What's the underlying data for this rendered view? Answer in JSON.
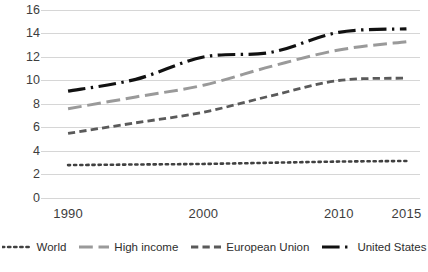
{
  "chart_data": {
    "type": "line",
    "title": "",
    "subtitle": "",
    "xlabel": "",
    "ylabel": "",
    "x": [
      1990,
      2000,
      2010,
      2015
    ],
    "categories": [
      "1990",
      "2000",
      "2010",
      "2015"
    ],
    "xtick_labels": [
      "1990",
      "2000",
      "2010",
      "2015"
    ],
    "ytick_labels": [
      "0",
      "2",
      "4",
      "6",
      "8",
      "10",
      "12",
      "14",
      "16"
    ],
    "yticks": [
      0,
      2,
      4,
      6,
      8,
      10,
      12,
      14,
      16
    ],
    "ylim": [
      0,
      16
    ],
    "xlim": [
      1988,
      2016
    ],
    "grid": "horizontal",
    "legend_position": "bottom",
    "series": [
      {
        "name": "World",
        "x": [
          1990,
          1995,
          2000,
          2005,
          2010,
          2015
        ],
        "values": [
          2.8,
          2.85,
          2.9,
          3.0,
          3.1,
          3.15
        ],
        "color": "#404040",
        "dash": "dotted",
        "width": 2.6
      },
      {
        "name": "High income",
        "x": [
          1990,
          1995,
          2000,
          2005,
          2010,
          2015
        ],
        "values": [
          7.6,
          8.6,
          9.6,
          11.2,
          12.6,
          13.3
        ],
        "color": "#9a9a9a",
        "dash": "long-dash",
        "width": 3.0
      },
      {
        "name": "European Union",
        "x": [
          1990,
          1995,
          2000,
          2005,
          2010,
          2015
        ],
        "values": [
          5.5,
          6.4,
          7.3,
          8.7,
          10.0,
          10.2
        ],
        "color": "#5a5a5a",
        "dash": "dash",
        "width": 2.8
      },
      {
        "name": "United States",
        "x": [
          1990,
          1995,
          2000,
          2005,
          2010,
          2015
        ],
        "values": [
          9.1,
          10.1,
          12.0,
          12.4,
          14.1,
          14.4
        ],
        "color": "#111111",
        "dash": "dash-dot",
        "width": 3.2
      }
    ]
  },
  "legend": {
    "items": [
      {
        "label": "World",
        "swatch": "dotted-line-swatch"
      },
      {
        "label": "High income",
        "swatch": "long-dashed-line-swatch"
      },
      {
        "label": "European Union",
        "swatch": "dashed-line-swatch"
      },
      {
        "label": "United States",
        "swatch": "solid-line-swatch"
      }
    ]
  },
  "caption": {
    "text": ""
  }
}
